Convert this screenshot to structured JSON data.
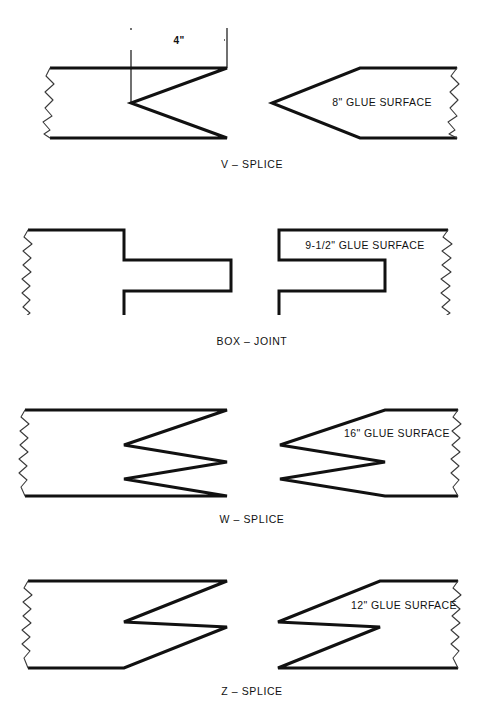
{
  "sheet": {
    "title": "Wood Splice Joint Types",
    "background_color": "#ffffff",
    "line_color": "#111111"
  },
  "dimension": {
    "value": "4\"",
    "icon": "dimension-arrow-icon"
  },
  "figures": [
    {
      "id": "v-splice",
      "caption": "V – SPLICE",
      "glue_label": "8\" GLUE SURFACE",
      "left_piece": "board-with-v-notch",
      "right_piece": "board-with-v-point"
    },
    {
      "id": "box-joint",
      "caption": "BOX – JOINT",
      "glue_label": "9-1/2\" GLUE SURFACE",
      "left_piece": "board-with-tongue",
      "right_piece": "board-with-slot"
    },
    {
      "id": "w-splice",
      "caption": "W – SPLICE",
      "glue_label": "16\" GLUE SURFACE",
      "left_piece": "board-with-double-v-notch",
      "right_piece": "board-with-double-v-point"
    },
    {
      "id": "z-splice",
      "caption": "Z – SPLICE",
      "glue_label": "12\" GLUE SURFACE",
      "left_piece": "board-with-z-cut",
      "right_piece": "board-with-z-point"
    }
  ]
}
